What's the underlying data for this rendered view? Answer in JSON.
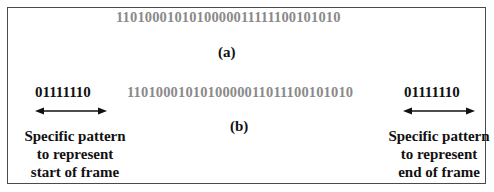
{
  "figure": {
    "panel_a": {
      "bitstream": "1101000101010000011111100101010",
      "label": "(a)"
    },
    "panel_b": {
      "bitstream": "1101000101010000011011100101010",
      "label": "(b)",
      "start_flag": "01111110",
      "end_flag": "01111110",
      "start_note": [
        "Specific pattern",
        "to represent",
        "start of frame"
      ],
      "end_note": [
        "Specific pattern",
        "to represent",
        "end of frame"
      ]
    },
    "colors": {
      "bitstream": "#8a8a8a",
      "text": "#111111",
      "border": "#4a4a4a"
    }
  }
}
